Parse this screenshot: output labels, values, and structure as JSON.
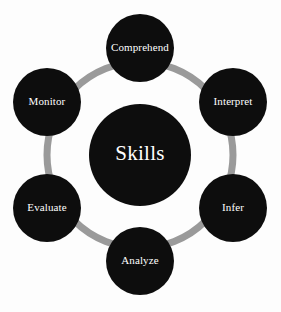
{
  "diagram": {
    "title": "Skills",
    "type": "cycle-hub-and-spoke",
    "background_color": "#fdfdfd",
    "node_color": "#0d0d0d",
    "ring_color": "#9a9a9a",
    "label_color": "#ffffff",
    "hub": {
      "label": "Skills",
      "cx": 140,
      "cy": 155,
      "r": 51
    },
    "ring": {
      "cx": 140,
      "cy": 155,
      "r": 93,
      "stroke_width": 7
    },
    "nodes": [
      {
        "id": "comprehend",
        "label": "Comprehend",
        "cx": 140,
        "cy": 48,
        "r": 34,
        "angle_deg": 90,
        "font_size": 10
      },
      {
        "id": "interpret",
        "label": "Interpret",
        "cx": 233,
        "cy": 102,
        "r": 34,
        "angle_deg": 30,
        "font_size": 10.5
      },
      {
        "id": "infer",
        "label": "Infer",
        "cx": 233,
        "cy": 208,
        "r": 34,
        "angle_deg": -30,
        "font_size": 11
      },
      {
        "id": "analyze",
        "label": "Analyze",
        "cx": 140,
        "cy": 261,
        "r": 34,
        "angle_deg": -90,
        "font_size": 11
      },
      {
        "id": "evaluate",
        "label": "Evaluate",
        "cx": 47,
        "cy": 208,
        "r": 34,
        "angle_deg": -150,
        "font_size": 10.5
      },
      {
        "id": "monitor",
        "label": "Monitor",
        "cx": 47,
        "cy": 102,
        "r": 34,
        "angle_deg": 150,
        "font_size": 11
      }
    ]
  }
}
